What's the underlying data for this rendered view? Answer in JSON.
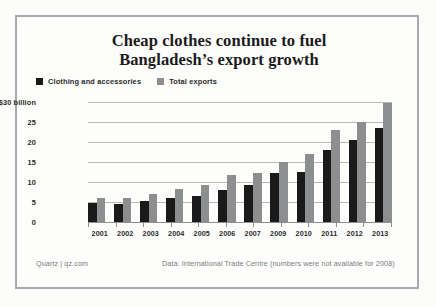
{
  "chart_data": {
    "type": "bar",
    "title_line1": "Cheap clothes continue to fuel",
    "title_line2": "Bangladesh’s export growth",
    "xlabel": "",
    "ylabel": "",
    "ylim": [
      0,
      30
    ],
    "grid": true,
    "legend_position": "top-left",
    "ytick_labels": [
      "0",
      "5",
      "10",
      "15",
      "20",
      "25",
      "$30 billion"
    ],
    "ytick_values": [
      0,
      5,
      10,
      15,
      20,
      25,
      30
    ],
    "categories": [
      "2001",
      "2002",
      "2003",
      "2004",
      "2005",
      "2006",
      "2007",
      "2009",
      "2010",
      "2011",
      "2012",
      "2013"
    ],
    "series": [
      {
        "name": "Clothing and accessories",
        "color": "#1a1a1a",
        "values": [
          4.8,
          4.6,
          5.3,
          6.0,
          6.4,
          8.0,
          9.2,
          12.3,
          12.6,
          17.9,
          20.5,
          23.5
        ]
      },
      {
        "name": "Total exports",
        "color": "#8d8e90",
        "values": [
          6.1,
          6.1,
          6.9,
          8.2,
          9.3,
          11.8,
          12.2,
          15.1,
          16.9,
          23.0,
          24.9,
          29.8
        ]
      }
    ],
    "annotations": {
      "source_credit": "Quartz | qz.com",
      "source_data": "Data: International Trade Centre (numbers were not available for 2008)"
    }
  },
  "legend": {
    "items": [
      {
        "label": "Clothing and accessories",
        "color": "#1a1a1a"
      },
      {
        "label": "Total exports",
        "color": "#8d8e90"
      }
    ]
  },
  "colors": {
    "series_dark": "#1a1a1a",
    "series_gray": "#8d8e90",
    "frame": "#a9aaac",
    "gridline": "#b9b9b6",
    "text": "#2b2b2b",
    "footer_text": "#7b7c7e",
    "background": "#fdfdfc"
  }
}
